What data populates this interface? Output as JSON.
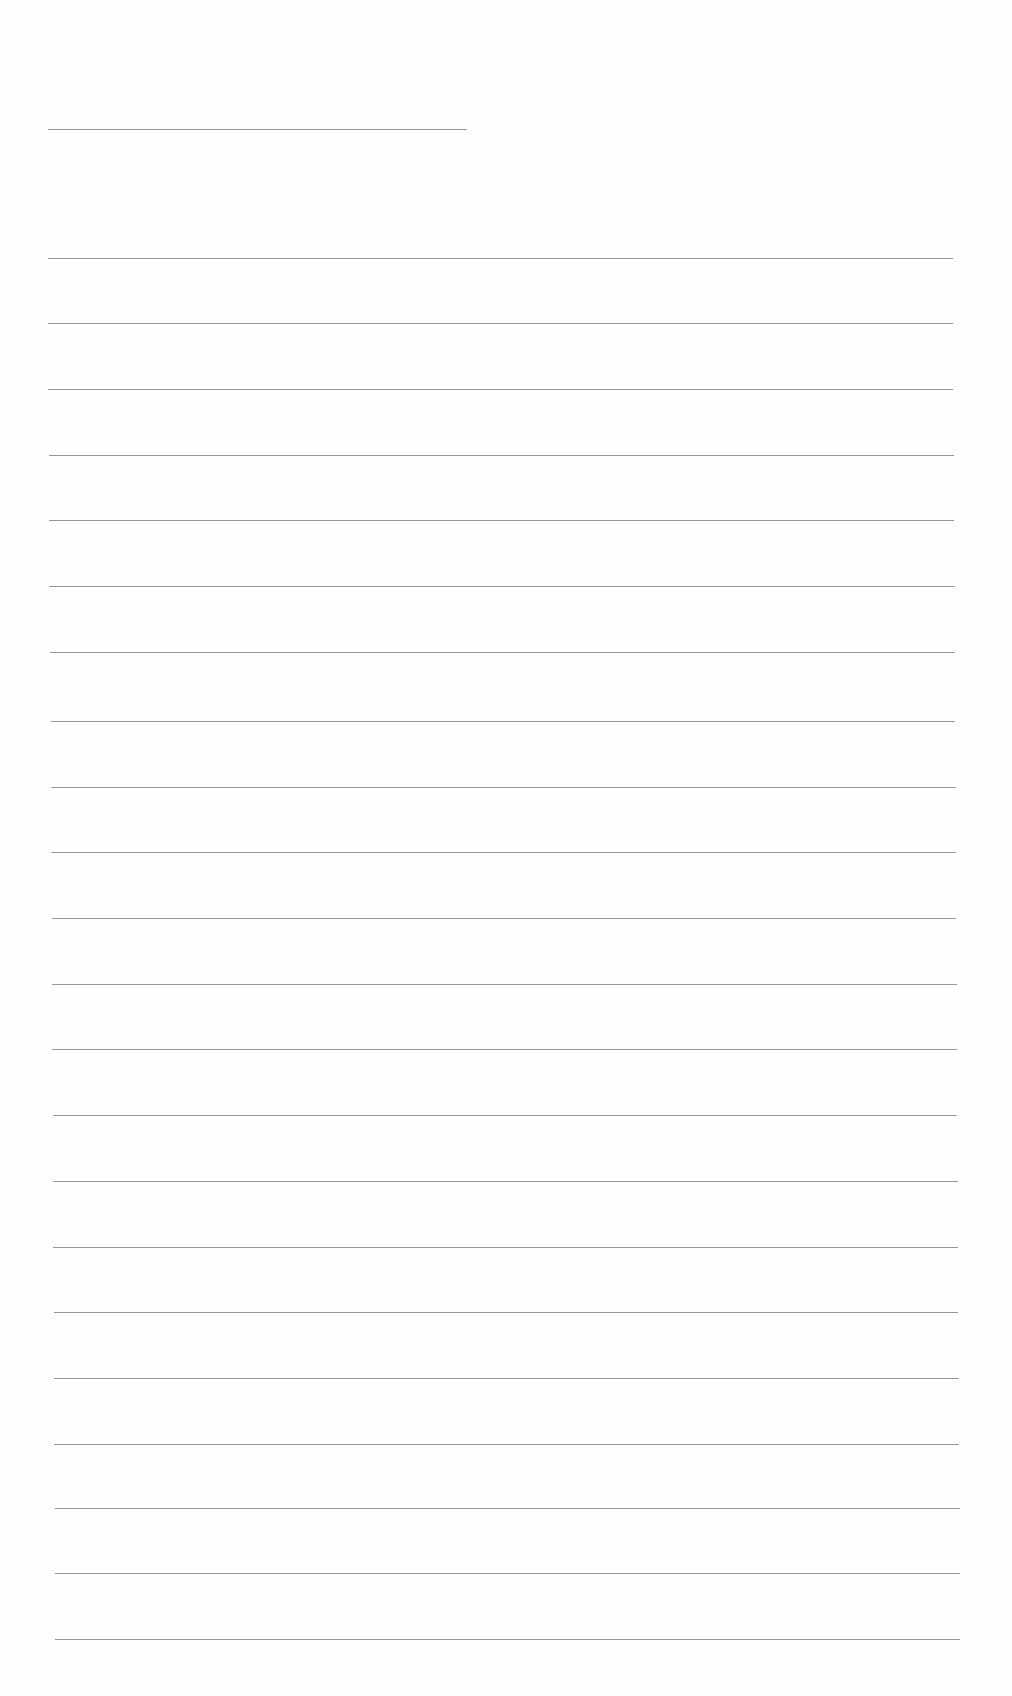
{
  "page": {
    "type": "blank-lined-sheet",
    "background": "#fefefe",
    "line_color": "#8c8c8c"
  },
  "header_line": {
    "x1": 48,
    "x2": 467,
    "y": 129
  },
  "ruled_lines": [
    {
      "x1": 48,
      "x2": 953,
      "y": 258
    },
    {
      "x1": 48,
      "x2": 953,
      "y": 323
    },
    {
      "x1": 48,
      "x2": 953,
      "y": 389
    },
    {
      "x1": 49,
      "x2": 954,
      "y": 455
    },
    {
      "x1": 49,
      "x2": 954,
      "y": 520
    },
    {
      "x1": 49,
      "x2": 955,
      "y": 586
    },
    {
      "x1": 50,
      "x2": 955,
      "y": 652
    },
    {
      "x1": 51,
      "x2": 955,
      "y": 721
    },
    {
      "x1": 51,
      "x2": 956,
      "y": 787
    },
    {
      "x1": 51,
      "x2": 956,
      "y": 852
    },
    {
      "x1": 52,
      "x2": 956,
      "y": 918
    },
    {
      "x1": 52,
      "x2": 957,
      "y": 984
    },
    {
      "x1": 52,
      "x2": 957,
      "y": 1049
    },
    {
      "x1": 53,
      "x2": 957,
      "y": 1115
    },
    {
      "x1": 53,
      "x2": 958,
      "y": 1181
    },
    {
      "x1": 53,
      "x2": 958,
      "y": 1247
    },
    {
      "x1": 54,
      "x2": 958,
      "y": 1312
    },
    {
      "x1": 54,
      "x2": 959,
      "y": 1378
    },
    {
      "x1": 54,
      "x2": 959,
      "y": 1444
    },
    {
      "x1": 55,
      "x2": 960,
      "y": 1508
    },
    {
      "x1": 55,
      "x2": 960,
      "y": 1573
    },
    {
      "x1": 55,
      "x2": 960,
      "y": 1639
    }
  ]
}
